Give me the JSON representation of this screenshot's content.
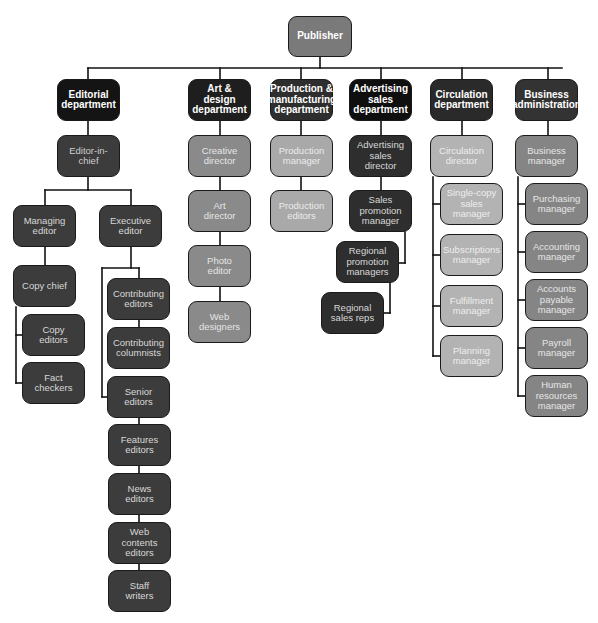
{
  "colors": {
    "publisher": "#7a7a7a",
    "dept_black": "#141414",
    "dept_dark": "#333333",
    "editorial_staff": "#3c3c3c",
    "art_staff": "#8a8a8a",
    "production_staff": "#a9a9a9",
    "advertising_staff": "#2e2e2e",
    "circulation_staff": "#b3b3b3",
    "business_staff": "#858585",
    "line": "#111111"
  },
  "nodes": [
    {
      "id": "publisher",
      "label": "Publisher",
      "x": 288,
      "y": 16,
      "w": 64,
      "h": 41,
      "fill": "#7a7a7a",
      "color": "#ffffff",
      "bold": true
    },
    {
      "id": "editorial",
      "label": "Editorial\ndepartment",
      "x": 57,
      "y": 79,
      "w": 63,
      "h": 42,
      "fill": "#141414",
      "color": "#ffffff",
      "bold": true
    },
    {
      "id": "art",
      "label": "Art & design\ndepartment",
      "x": 188,
      "y": 79,
      "w": 63,
      "h": 42,
      "fill": "#1e1e1e",
      "color": "#ffffff",
      "bold": true
    },
    {
      "id": "production",
      "label": "Production &\nmanufacturing\ndepartment",
      "x": 270,
      "y": 79,
      "w": 63,
      "h": 42,
      "fill": "#2e2e2e",
      "color": "#ffffff",
      "bold": true
    },
    {
      "id": "advertising",
      "label": "Advertising\nsales\ndepartment",
      "x": 349,
      "y": 79,
      "w": 63,
      "h": 42,
      "fill": "#0f0f0f",
      "color": "#ffffff",
      "bold": true
    },
    {
      "id": "circulation",
      "label": "Circulation\ndepartment",
      "x": 430,
      "y": 79,
      "w": 63,
      "h": 42,
      "fill": "#2a2a2a",
      "color": "#ffffff",
      "bold": true
    },
    {
      "id": "business",
      "label": "Business\nadministration",
      "x": 515,
      "y": 79,
      "w": 63,
      "h": 42,
      "fill": "#333333",
      "color": "#ffffff",
      "bold": true
    },
    {
      "id": "eic",
      "label": "Editor-in-\nchief",
      "x": 57,
      "y": 135,
      "w": 63,
      "h": 42,
      "fill": "#3c3c3c",
      "color": "#cfcfcf"
    },
    {
      "id": "managing",
      "label": "Managing\neditor",
      "x": 13,
      "y": 205,
      "w": 63,
      "h": 42,
      "fill": "#3c3c3c",
      "color": "#d8d8d8"
    },
    {
      "id": "executive",
      "label": "Executive\neditor",
      "x": 99,
      "y": 205,
      "w": 63,
      "h": 42,
      "fill": "#3c3c3c",
      "color": "#d8d8d8"
    },
    {
      "id": "copychief",
      "label": "Copy chief",
      "x": 13,
      "y": 265,
      "w": 63,
      "h": 42,
      "fill": "#3c3c3c",
      "color": "#d8d8d8"
    },
    {
      "id": "copyeditors",
      "label": "Copy\neditors",
      "x": 22,
      "y": 314,
      "w": 63,
      "h": 42,
      "fill": "#3c3c3c",
      "color": "#d8d8d8"
    },
    {
      "id": "factcheckers",
      "label": "Fact\ncheckers",
      "x": 22,
      "y": 362,
      "w": 63,
      "h": 42,
      "fill": "#3c3c3c",
      "color": "#d8d8d8"
    },
    {
      "id": "contrib_editors",
      "label": "Contributing\neditors",
      "x": 107,
      "y": 278,
      "w": 63,
      "h": 42,
      "fill": "#3c3c3c",
      "color": "#d8d8d8"
    },
    {
      "id": "contrib_columnists",
      "label": "Contributing\ncolumnists",
      "x": 107,
      "y": 327,
      "w": 63,
      "h": 42,
      "fill": "#3c3c3c",
      "color": "#d8d8d8"
    },
    {
      "id": "senior",
      "label": "Senior\neditors",
      "x": 107,
      "y": 376,
      "w": 63,
      "h": 42,
      "fill": "#3c3c3c",
      "color": "#d8d8d8"
    },
    {
      "id": "features",
      "label": "Features\neditors",
      "x": 108,
      "y": 424,
      "w": 63,
      "h": 42,
      "fill": "#3c3c3c",
      "color": "#d8d8d8"
    },
    {
      "id": "news",
      "label": "News\neditors",
      "x": 108,
      "y": 473,
      "w": 63,
      "h": 42,
      "fill": "#3c3c3c",
      "color": "#d8d8d8"
    },
    {
      "id": "webcontents",
      "label": "Web contents\neditors",
      "x": 108,
      "y": 522,
      "w": 63,
      "h": 42,
      "fill": "#3c3c3c",
      "color": "#d8d8d8"
    },
    {
      "id": "staffwriters",
      "label": "Staff\nwriters",
      "x": 108,
      "y": 570,
      "w": 63,
      "h": 42,
      "fill": "#3c3c3c",
      "color": "#d8d8d8"
    },
    {
      "id": "creative",
      "label": "Creative\ndirector",
      "x": 188,
      "y": 135,
      "w": 63,
      "h": 42,
      "fill": "#8a8a8a",
      "color": "#e6e6e6"
    },
    {
      "id": "artdir",
      "label": "Art\ndirector",
      "x": 188,
      "y": 190,
      "w": 63,
      "h": 42,
      "fill": "#8a8a8a",
      "color": "#e6e6e6"
    },
    {
      "id": "photo",
      "label": "Photo\neditor",
      "x": 188,
      "y": 245,
      "w": 63,
      "h": 42,
      "fill": "#8a8a8a",
      "color": "#e6e6e6"
    },
    {
      "id": "webdesigners",
      "label": "Web\ndesigners",
      "x": 188,
      "y": 301,
      "w": 63,
      "h": 42,
      "fill": "#8a8a8a",
      "color": "#e6e6e6"
    },
    {
      "id": "prodmgr",
      "label": "Production\nmanager",
      "x": 270,
      "y": 135,
      "w": 63,
      "h": 42,
      "fill": "#a9a9a9",
      "color": "#ececec"
    },
    {
      "id": "prodeditors",
      "label": "Production\neditors",
      "x": 270,
      "y": 190,
      "w": 63,
      "h": 42,
      "fill": "#a9a9a9",
      "color": "#ececec"
    },
    {
      "id": "adsdir",
      "label": "Advertising\nsales\ndirector",
      "x": 349,
      "y": 135,
      "w": 63,
      "h": 42,
      "fill": "#2e2e2e",
      "color": "#d8d8d8"
    },
    {
      "id": "salespromo",
      "label": "Sales\npromotion\nmanager",
      "x": 349,
      "y": 190,
      "w": 63,
      "h": 42,
      "fill": "#2e2e2e",
      "color": "#d8d8d8"
    },
    {
      "id": "regpromo",
      "label": "Regional\npromotion\nmanagers",
      "x": 336,
      "y": 241,
      "w": 63,
      "h": 42,
      "fill": "#2e2e2e",
      "color": "#d8d8d8"
    },
    {
      "id": "regreps",
      "label": "Regional\nsales reps",
      "x": 321,
      "y": 292,
      "w": 63,
      "h": 42,
      "fill": "#2e2e2e",
      "color": "#d8d8d8"
    },
    {
      "id": "circdir",
      "label": "Circulation\ndirector",
      "x": 430,
      "y": 135,
      "w": 63,
      "h": 42,
      "fill": "#b3b3b3",
      "color": "#eeeeee"
    },
    {
      "id": "singlecopy",
      "label": "Single-copy\nsales\nmanager",
      "x": 440,
      "y": 183,
      "w": 63,
      "h": 42,
      "fill": "#b3b3b3",
      "color": "#eeeeee"
    },
    {
      "id": "subscriptions",
      "label": "Subscriptions\nmanager",
      "x": 440,
      "y": 234,
      "w": 63,
      "h": 42,
      "fill": "#b3b3b3",
      "color": "#eeeeee"
    },
    {
      "id": "fulfillment",
      "label": "Fulfillment\nmanager",
      "x": 440,
      "y": 285,
      "w": 63,
      "h": 42,
      "fill": "#b3b3b3",
      "color": "#eeeeee"
    },
    {
      "id": "planning",
      "label": "Planning\nmanager",
      "x": 440,
      "y": 335,
      "w": 63,
      "h": 42,
      "fill": "#b3b3b3",
      "color": "#eeeeee"
    },
    {
      "id": "bizmgr",
      "label": "Business\nmanager",
      "x": 515,
      "y": 135,
      "w": 63,
      "h": 42,
      "fill": "#858585",
      "color": "#e6e6e6"
    },
    {
      "id": "purchasing",
      "label": "Purchasing\nmanager",
      "x": 525,
      "y": 183,
      "w": 63,
      "h": 42,
      "fill": "#858585",
      "color": "#e6e6e6"
    },
    {
      "id": "accounting",
      "label": "Accounting\nmanager",
      "x": 525,
      "y": 231,
      "w": 63,
      "h": 42,
      "fill": "#858585",
      "color": "#e6e6e6"
    },
    {
      "id": "payable",
      "label": "Accounts\npayable\nmanager",
      "x": 525,
      "y": 279,
      "w": 63,
      "h": 42,
      "fill": "#858585",
      "color": "#e6e6e6"
    },
    {
      "id": "payroll",
      "label": "Payroll\nmanager",
      "x": 525,
      "y": 327,
      "w": 63,
      "h": 42,
      "fill": "#858585",
      "color": "#e6e6e6"
    },
    {
      "id": "hr",
      "label": "Human\nresources\nmanager",
      "x": 525,
      "y": 375,
      "w": 63,
      "h": 42,
      "fill": "#858585",
      "color": "#e6e6e6"
    }
  ],
  "lines": [
    [
      320,
      57,
      320,
      68
    ],
    [
      88,
      68,
      562,
      68
    ],
    [
      88,
      68,
      88,
      79
    ],
    [
      220,
      68,
      220,
      79
    ],
    [
      301,
      68,
      301,
      79
    ],
    [
      381,
      68,
      381,
      79
    ],
    [
      462,
      68,
      462,
      79
    ],
    [
      548,
      68,
      548,
      79
    ],
    [
      88,
      121,
      88,
      135
    ],
    [
      88,
      177,
      88,
      190
    ],
    [
      45,
      190,
      131,
      190
    ],
    [
      45,
      190,
      45,
      205
    ],
    [
      131,
      190,
      131,
      205
    ],
    [
      45,
      247,
      45,
      265
    ],
    [
      16,
      307,
      16,
      383
    ],
    [
      16,
      335,
      22,
      335
    ],
    [
      16,
      383,
      22,
      383
    ],
    [
      131,
      247,
      131,
      268
    ],
    [
      102,
      268,
      139,
      268
    ],
    [
      139,
      268,
      139,
      278
    ],
    [
      102,
      268,
      102,
      397
    ],
    [
      102,
      397,
      107,
      397
    ],
    [
      139,
      320,
      139,
      327
    ],
    [
      139,
      418,
      139,
      424
    ],
    [
      139,
      466,
      139,
      473
    ],
    [
      139,
      515,
      139,
      522
    ],
    [
      139,
      564,
      139,
      570
    ],
    [
      220,
      121,
      220,
      135
    ],
    [
      220,
      177,
      220,
      190
    ],
    [
      220,
      232,
      220,
      245
    ],
    [
      220,
      287,
      220,
      301
    ],
    [
      301,
      121,
      301,
      135
    ],
    [
      301,
      177,
      301,
      190
    ],
    [
      381,
      121,
      381,
      135
    ],
    [
      381,
      177,
      381,
      190
    ],
    [
      405,
      232,
      405,
      263
    ],
    [
      399,
      263,
      405,
      263
    ],
    [
      390,
      283,
      390,
      313
    ],
    [
      384,
      313,
      390,
      313
    ],
    [
      462,
      121,
      462,
      135
    ],
    [
      433,
      177,
      433,
      356
    ],
    [
      433,
      204,
      440,
      204
    ],
    [
      433,
      255,
      440,
      255
    ],
    [
      433,
      306,
      440,
      306
    ],
    [
      433,
      356,
      440,
      356
    ],
    [
      548,
      121,
      548,
      135
    ],
    [
      518,
      177,
      518,
      396
    ],
    [
      518,
      204,
      525,
      204
    ],
    [
      518,
      252,
      525,
      252
    ],
    [
      518,
      300,
      525,
      300
    ],
    [
      518,
      348,
      525,
      348
    ],
    [
      518,
      396,
      525,
      396
    ]
  ]
}
